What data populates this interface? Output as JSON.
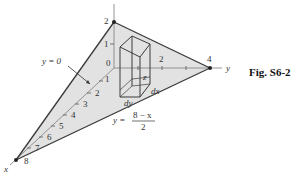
{
  "figure": {
    "caption": "Fig. S6-2",
    "axes": {
      "x_label": "x",
      "y_label": "y",
      "z_label": "z"
    },
    "vertices": {
      "z_intercept": "2",
      "y_intercept": "4",
      "x_intercept": "8"
    },
    "z_ticks": [
      "1",
      "0"
    ],
    "y_ticks": [
      "2"
    ],
    "x_ticks": [
      "1",
      "2",
      "3",
      "4",
      "5",
      "6",
      "7"
    ],
    "annotations": {
      "trace_y0": "y = 0",
      "trace_line_lhs": "y =",
      "trace_line_num": "8 − x",
      "trace_line_den": "2"
    },
    "element_labels": {
      "height": "z",
      "dx": "dx",
      "dy": "dy"
    },
    "colors": {
      "plane_fill": "#e2e2e2",
      "edges": "#3a3a3a",
      "axes": "#888888"
    }
  }
}
